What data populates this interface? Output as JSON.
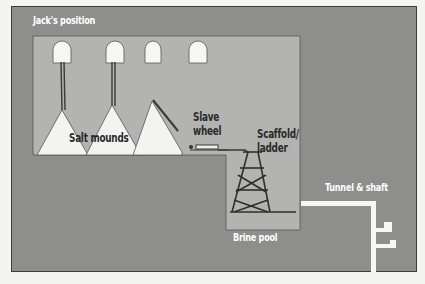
{
  "labels": {
    "jacks_position": "Jack's position",
    "salt_mounds": "Salt mounds",
    "slave_wheel": "Slave\nwheel",
    "scaffold_ladder": "Scaffold/\nladder",
    "brine_pool": "Brine pool",
    "tunnel_shaft": "Tunnel & shaft"
  },
  "colors": {
    "rock": "#8e8e8c",
    "chamber": "#b3b3b1",
    "salt": "#f3f3f1",
    "tunnel": "#f7f7f5",
    "structure": "#3a3a3a",
    "text_light": "#ffffff",
    "text_dark": "#2a2a2a"
  },
  "niches": [
    {
      "x": 53,
      "y": 42
    },
    {
      "x": 107,
      "y": 42
    },
    {
      "x": 145,
      "y": 42
    },
    {
      "x": 189,
      "y": 42
    }
  ]
}
